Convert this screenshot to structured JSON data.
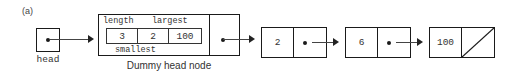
{
  "figure": {
    "panel_label": "(a)",
    "caption": "Dummy head node"
  },
  "head_pointer": {
    "label": "head",
    "icon": "pointer-dot-icon"
  },
  "dummy_head_node": {
    "field_captions": {
      "top_left": "length",
      "top_right": "largest",
      "bottom_center": "smallest"
    },
    "fields": [
      {
        "name": "length",
        "value": "3"
      },
      {
        "name": "smallest",
        "value": "2"
      },
      {
        "name": "largest",
        "value": "100"
      }
    ],
    "next_pointer_icon": "pointer-dot-icon"
  },
  "list_nodes": [
    {
      "value": "2",
      "next": "pointer-dot-icon"
    },
    {
      "value": "6",
      "next": "pointer-dot-icon"
    },
    {
      "value": "100",
      "next": "null-slash-icon"
    }
  ],
  "colors": {
    "stroke": "#1a1a1a",
    "text": "#333333",
    "arrow": "#444444",
    "background": "#ffffff"
  }
}
